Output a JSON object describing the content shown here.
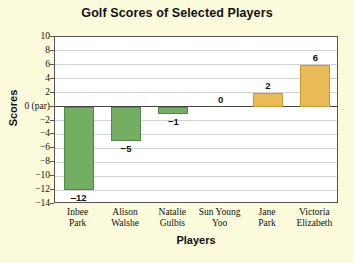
{
  "chart_data": {
    "type": "bar",
    "title": "Golf Scores of Selected Players",
    "xlabel": "Players",
    "ylabel": "Scores",
    "categories": [
      "Inbee Park",
      "Alison Walshe",
      "Natalie Gulbis",
      "Sun Young Yoo",
      "Jane Park",
      "Victoria Elizabeth"
    ],
    "category_lines": [
      [
        "Inbee",
        "Park"
      ],
      [
        "Alison",
        "Walshe"
      ],
      [
        "Natalie",
        "Gulbis"
      ],
      [
        "Sun Young",
        "Yoo"
      ],
      [
        "Jane",
        "Park"
      ],
      [
        "Victoria",
        "Elizabeth"
      ]
    ],
    "values": [
      -12,
      -5,
      -1,
      0,
      2,
      6
    ],
    "value_labels": [
      "‒12",
      "−5",
      "−1",
      "0",
      "2",
      "6"
    ],
    "ylim": [
      -14,
      10
    ],
    "ytick_values": [
      10,
      8,
      6,
      4,
      2,
      0,
      -2,
      -4,
      -6,
      -8,
      -10,
      -12,
      -14
    ],
    "ytick_labels": [
      "10",
      "8",
      "6",
      "4",
      "2",
      "0 (par)",
      "−2",
      "−4",
      "−6",
      "−8",
      "−10",
      "−12",
      "−14"
    ],
    "grid": true,
    "legend": "none",
    "colors": {
      "negative_bar": "#74ae63",
      "negative_bar_edge": "#4f8a44",
      "positive_bar": "#e9bb56",
      "positive_bar_edge": "#c79a33",
      "plot_background": "#ffffff",
      "page_background": "#fbfbdc",
      "gridline": "#d2d2d2",
      "axis": "#555555",
      "zero_line": "#444444",
      "text": "#111111"
    }
  }
}
